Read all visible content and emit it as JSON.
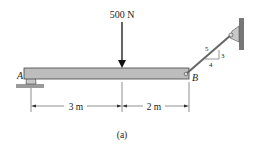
{
  "figure": {
    "caption": "(a)",
    "load": {
      "label": "500 N",
      "direction": "down"
    },
    "points": {
      "A": "A",
      "B": "B"
    },
    "dimensions": [
      {
        "label": "3 m",
        "from": "A",
        "to": "load"
      },
      {
        "label": "2 m",
        "from": "load",
        "to": "B"
      }
    ],
    "cable_slope": {
      "hyp": "5",
      "rise": "3",
      "run": "4"
    },
    "colors": {
      "beam": "#bdbdbd",
      "line": "#333333",
      "support": "#9e9e9e"
    }
  }
}
